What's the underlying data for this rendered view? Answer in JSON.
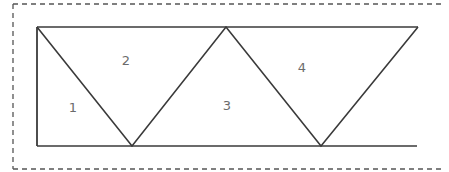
{
  "diagram": {
    "colors": {
      "line": "#3a3a3a",
      "frame": "#555555",
      "label": "#6b6b6b",
      "background": "#ffffff"
    },
    "frame": {
      "style": "dashed",
      "left": 13,
      "top": 4,
      "right": 441,
      "bottom": 169
    },
    "shape": {
      "top_line": {
        "x1": 37,
        "y1": 27,
        "x2": 418,
        "y2": 27
      },
      "bottom_line": {
        "x1": 37,
        "y1": 146,
        "x2": 417,
        "y2": 146
      },
      "left_edge": {
        "x1": 37,
        "y1": 27,
        "x2": 37,
        "y2": 146
      },
      "zigzag_points": [
        [
          37,
          27
        ],
        [
          132,
          146
        ],
        [
          226,
          27
        ],
        [
          321,
          146
        ],
        [
          418,
          27
        ]
      ]
    },
    "regions": [
      {
        "label": "1",
        "x": 73,
        "y": 112
      },
      {
        "label": "2",
        "x": 126,
        "y": 65
      },
      {
        "label": "3",
        "x": 227,
        "y": 110
      },
      {
        "label": "4",
        "x": 302,
        "y": 72
      }
    ]
  }
}
